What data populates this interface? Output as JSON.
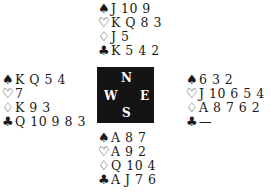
{
  "suits": {
    "spades": "♠",
    "hearts": "♡",
    "diamonds": "♢",
    "clubs": "♣"
  },
  "compass": {
    "n": "N",
    "s": "S",
    "w": "W",
    "e": "E"
  },
  "hands": {
    "north": {
      "spades": "J 10 9",
      "hearts": "K Q 8 3",
      "diamonds": "J 5",
      "clubs": "K 5 4 2"
    },
    "west": {
      "spades": "K Q 5 4",
      "hearts": "7",
      "diamonds": "K 9 3",
      "clubs": "Q 10 9 8 3"
    },
    "east": {
      "spades": "6 3 2",
      "hearts": "J 10 6 5 4",
      "diamonds": "A 8 7 6 2",
      "clubs": "—"
    },
    "south": {
      "spades": "A 8 7",
      "hearts": "A 9 2",
      "diamonds": "Q 10 4",
      "clubs": "A J 7 6"
    }
  }
}
